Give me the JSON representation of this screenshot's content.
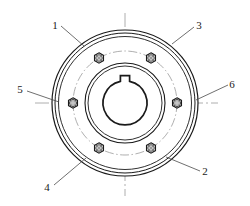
{
  "drawing": {
    "title": "Flange Coupling End View",
    "view_type": "sectional end view",
    "background_color": "#ffffff",
    "line_color": "#1a1a1a",
    "centerline_color": "#8c8c8c",
    "geometry": {
      "center": {
        "x": 125,
        "y": 103
      },
      "outer_flange_radius_outer": 73,
      "outer_flange_radius_inner": 70,
      "rim_inner_radius": 66,
      "hub_radius_outer": 40,
      "hub_radius_inner": 37,
      "bore_radius": 22,
      "bolt_circle_radius": 52,
      "bolt_count": 6,
      "bolt_head_across_flats": 9,
      "keyway": {
        "width": 9,
        "depth": 6,
        "position": "top"
      }
    },
    "bolts": [
      {
        "id": "bolt-top-left",
        "angle_deg": 240,
        "style": "hex-socket"
      },
      {
        "id": "bolt-top-right",
        "angle_deg": 300,
        "style": "hex-socket"
      },
      {
        "id": "bolt-left",
        "angle_deg": 180,
        "style": "hex-ring"
      },
      {
        "id": "bolt-right",
        "angle_deg": 0,
        "style": "hex-ring"
      },
      {
        "id": "bolt-bottom-left",
        "angle_deg": 120,
        "style": "hex-socket"
      },
      {
        "id": "bolt-bottom-right",
        "angle_deg": 60,
        "style": "hex-socket"
      }
    ],
    "callouts": [
      {
        "id": "callout-1",
        "label": "1",
        "text_x": 55,
        "text_y": 29,
        "leader": {
          "x1": 61,
          "y1": 26,
          "x2": 84,
          "y2": 46
        }
      },
      {
        "id": "callout-3",
        "label": "3",
        "text_x": 196,
        "text_y": 29,
        "leader": {
          "x1": 194,
          "y1": 27,
          "x2": 172,
          "y2": 44
        }
      },
      {
        "id": "callout-5",
        "label": "5",
        "text_x": 20,
        "text_y": 93,
        "leader": {
          "x1": 27,
          "y1": 91,
          "x2": 59,
          "y2": 102
        }
      },
      {
        "id": "callout-6",
        "label": "6",
        "text_x": 229,
        "text_y": 87,
        "leader": {
          "x1": 228,
          "y1": 85,
          "x2": 196,
          "y2": 100
        }
      },
      {
        "id": "callout-4",
        "label": "4",
        "text_x": 47,
        "text_y": 190,
        "leader": {
          "x1": 54,
          "y1": 185,
          "x2": 86,
          "y2": 158
        }
      },
      {
        "id": "callout-2",
        "label": "2",
        "text_x": 203,
        "text_y": 174,
        "leader": {
          "x1": 200,
          "y1": 171,
          "x2": 166,
          "y2": 157
        }
      }
    ],
    "centerlines": {
      "horizontal": {
        "x1": 35,
        "y1": 103,
        "x2": 218,
        "y2": 103
      },
      "vertical": {
        "x1": 125,
        "y1": 13,
        "x2": 125,
        "y2": 196
      }
    }
  }
}
